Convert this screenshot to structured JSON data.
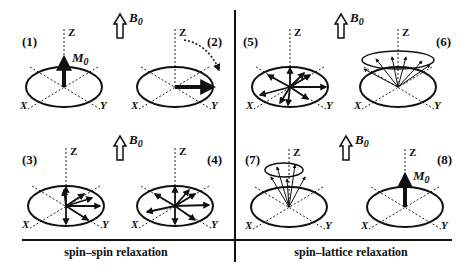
{
  "diagram": {
    "field_label": "B",
    "field_subscript": "0",
    "magnetization_label": "M",
    "magnetization_subscript": "0",
    "axis_labels": {
      "z": "Z",
      "x": "X",
      "y": "Y"
    },
    "panels": [
      {
        "id": "1",
        "label": "(1)"
      },
      {
        "id": "2",
        "label": "(2)"
      },
      {
        "id": "3",
        "label": "(3)"
      },
      {
        "id": "4",
        "label": "(4)"
      },
      {
        "id": "5",
        "label": "(5)"
      },
      {
        "id": "6",
        "label": "(6)"
      },
      {
        "id": "7",
        "label": "(7)"
      },
      {
        "id": "8",
        "label": "(8)"
      }
    ],
    "sections": {
      "left_caption": "spin–spin relaxation",
      "right_caption": "spin–lattice relaxation"
    }
  }
}
